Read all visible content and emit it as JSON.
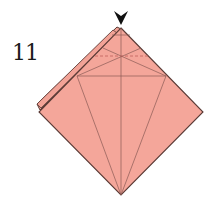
{
  "step": {
    "number": "11"
  },
  "diagram": {
    "type": "origami-fold-step",
    "paper_color": "#f4a69a",
    "paper_back_color": "#efa093",
    "edge_color": "#5a3a35",
    "crease_color": "#8a5a55",
    "arrow_color": "#111111",
    "arrow": {
      "type": "push-arrow",
      "direction": "down",
      "target": "top-vertex"
    },
    "shape": "diamond-with-offset-back-layer",
    "lines": [
      "center-vertical-crease",
      "horizontal-crease",
      "kite-diagonals",
      "x-crease",
      "dashed-valley-fold"
    ]
  }
}
